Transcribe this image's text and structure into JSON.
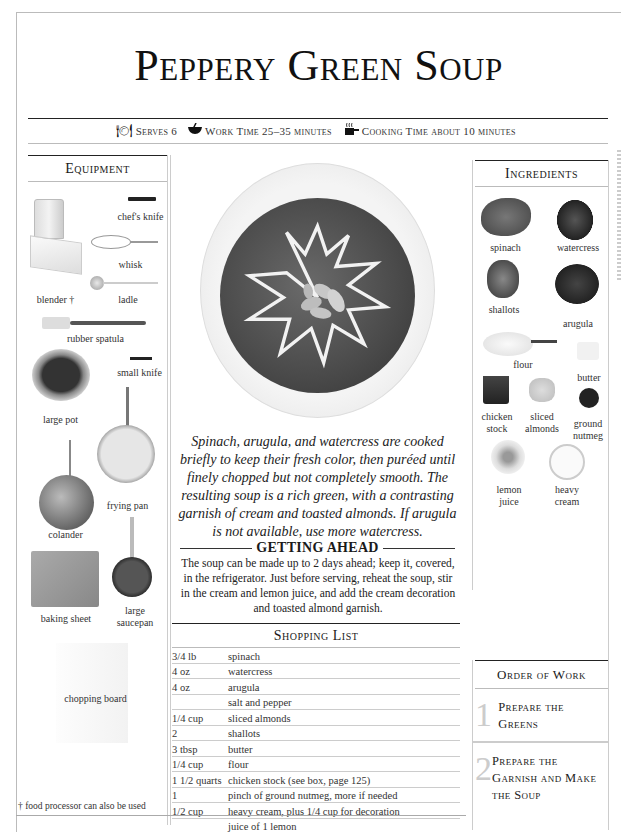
{
  "title": "Peppery Green Soup",
  "meta": {
    "serves_icon": "place-setting-icon",
    "serves": "Serves 6",
    "work_icon": "mixing-bowl-icon",
    "work_time": "Work Time 25–35 minutes",
    "cook_icon": "steaming-pot-icon",
    "cooking_time": "Cooking Time about 10 minutes"
  },
  "equipment": {
    "heading": "Equipment",
    "items": [
      {
        "label": "chef's knife"
      },
      {
        "label": "whisk"
      },
      {
        "label": "blender †"
      },
      {
        "label": "ladle"
      },
      {
        "label": "rubber spatula"
      },
      {
        "label": "small knife"
      },
      {
        "label": "large pot"
      },
      {
        "label": "frying pan"
      },
      {
        "label": "colander"
      },
      {
        "label": "baking sheet"
      },
      {
        "label": "large saucepan"
      },
      {
        "label": "chopping board"
      }
    ],
    "footnote": "† food processor can also be used"
  },
  "intro": "Spinach, arugula, and watercress are cooked briefly to keep their fresh color, then puréed until finely chopped but not completely smooth. The resulting soup is a rich green, with a contrasting garnish of cream and toasted almonds. If arugula is not available, use more watercress.",
  "getting_ahead": {
    "heading": "GETTING AHEAD",
    "text": "The soup can be made up to 2 days ahead; keep it, covered, in the refrigerator. Just before serving, reheat the soup, stir in the cream and lemon juice, and add the cream decoration and toasted almond garnish."
  },
  "shopping_list": {
    "heading": "Shopping List",
    "rows": [
      {
        "qty": "3/4 lb",
        "item": "spinach"
      },
      {
        "qty": "4 oz",
        "item": "watercress"
      },
      {
        "qty": "4 oz",
        "item": "arugula"
      },
      {
        "qty": "",
        "item": "salt and pepper"
      },
      {
        "qty": "1/4 cup",
        "item": "sliced almonds"
      },
      {
        "qty": "2",
        "item": "shallots"
      },
      {
        "qty": "3 tbsp",
        "item": "butter"
      },
      {
        "qty": "1/4 cup",
        "item": "flour"
      },
      {
        "qty": "1 1/2 quarts",
        "item": "chicken stock (see box, page 125)"
      },
      {
        "qty": "1",
        "item": "pinch of ground nutmeg, more if needed"
      },
      {
        "qty": "1/2 cup",
        "item": "heavy cream, plus 1/4 cup for decoration"
      },
      {
        "qty": "",
        "item": "juice of 1 lemon"
      }
    ]
  },
  "ingredients": {
    "heading": "Ingredients",
    "items": [
      {
        "label": "spinach"
      },
      {
        "label": "watercress"
      },
      {
        "label": "shallots"
      },
      {
        "label": "arugula"
      },
      {
        "label": "flour"
      },
      {
        "label": "butter"
      },
      {
        "label": "chicken stock"
      },
      {
        "label": "sliced almonds"
      },
      {
        "label": "ground nutmeg"
      },
      {
        "label": "lemon juice"
      },
      {
        "label": "heavy cream"
      }
    ]
  },
  "order_of_work": {
    "heading": "Order of Work",
    "steps": [
      {
        "num": "1",
        "text": "Prepare the Greens"
      },
      {
        "num": "2",
        "text": "Prepare the Garnish and Make the Soup"
      }
    ]
  },
  "colors": {
    "rule": "#222222",
    "light_rule": "#cccccc",
    "step_number": "#cccccc"
  }
}
